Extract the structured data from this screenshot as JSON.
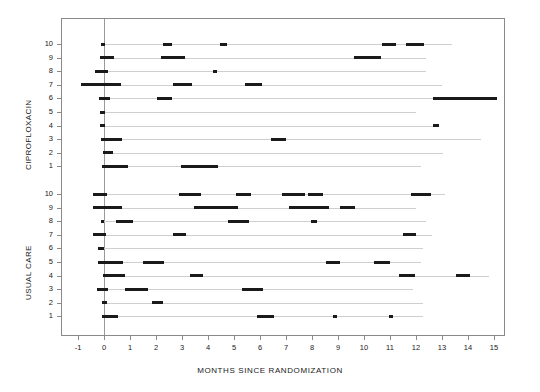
{
  "chart_data": {
    "type": "table",
    "title": "",
    "xlabel": "MONTHS SINCE RANDOMIZATION",
    "ylabel": "",
    "xlim": [
      -1.6,
      15.6
    ],
    "xticks": [
      -1,
      0,
      1,
      2,
      3,
      4,
      5,
      6,
      7,
      8,
      9,
      10,
      11,
      12,
      13,
      14,
      15
    ],
    "xticklabels": [
      "-1",
      "0",
      "1",
      "2",
      "3",
      "4",
      "5",
      "6",
      "7",
      "8",
      "9",
      "10",
      "11",
      "12",
      "13",
      "14",
      "15"
    ],
    "grid": false,
    "legend": null,
    "reference_line_x": 0,
    "groups": [
      {
        "name": "CIPROFLOXACIN",
        "label": "CIPROFLOXACIN",
        "subject_labels": [
          "10",
          "9",
          "8",
          "7",
          "6",
          "5",
          "4",
          "3",
          "2",
          "1"
        ],
        "subjects": [
          {
            "id": "10",
            "followup_end": 13.4,
            "episodes": [
              [
                -0.1,
                0.05
              ],
              [
                2.25,
                2.6
              ],
              [
                4.45,
                4.75
              ],
              [
                10.7,
                11.25
              ],
              [
                11.6,
                12.3
              ]
            ]
          },
          {
            "id": "9",
            "followup_end": 12.4,
            "episodes": [
              [
                -0.15,
                0.4
              ],
              [
                2.2,
                3.1
              ],
              [
                9.6,
                10.65
              ]
            ]
          },
          {
            "id": "8",
            "followup_end": 12.4,
            "episodes": [
              [
                -0.35,
                0.15
              ],
              [
                4.2,
                4.35
              ]
            ]
          },
          {
            "id": "7",
            "followup_end": 13.0,
            "episodes": [
              [
                -0.9,
                0.65
              ],
              [
                2.65,
                3.38
              ],
              [
                5.42,
                6.08
              ]
            ]
          },
          {
            "id": "6",
            "followup_end": 15.1,
            "episodes": [
              [
                -0.2,
                0.25
              ],
              [
                2.03,
                2.6
              ],
              [
                12.65,
                15.1
              ]
            ]
          },
          {
            "id": "5",
            "followup_end": 12.0,
            "episodes": [
              [
                -0.15,
                0.05
              ]
            ]
          },
          {
            "id": "4",
            "followup_end": 12.9,
            "episodes": [
              [
                -0.15,
                0.05
              ],
              [
                12.65,
                12.9
              ]
            ]
          },
          {
            "id": "3",
            "followup_end": 14.5,
            "episodes": [
              [
                -0.1,
                0.68
              ],
              [
                6.42,
                7.0
              ]
            ]
          },
          {
            "id": "2",
            "followup_end": 13.05,
            "episodes": [
              [
                -0.05,
                0.36
              ]
            ]
          },
          {
            "id": "1",
            "followup_end": 12.2,
            "episodes": [
              [
                -0.09,
                0.93
              ],
              [
                2.95,
                4.4
              ]
            ]
          }
        ]
      },
      {
        "name": "USUAL CARE",
        "label": "USUAL CARE",
        "subject_labels": [
          "10",
          "9",
          "8",
          "7",
          "6",
          "5",
          "4",
          "3",
          "2",
          "1"
        ],
        "subjects": [
          {
            "id": "10",
            "followup_end": 13.1,
            "episodes": [
              [
                -0.44,
                0.1
              ],
              [
                2.9,
                3.72
              ],
              [
                5.07,
                5.65
              ],
              [
                6.84,
                7.73
              ],
              [
                7.86,
                8.41
              ],
              [
                11.8,
                12.57
              ]
            ]
          },
          {
            "id": "9",
            "followup_end": 12.0,
            "episodes": [
              [
                -0.41,
                0.68
              ],
              [
                3.46,
                5.14
              ],
              [
                7.12,
                8.67
              ],
              [
                9.07,
                9.65
              ]
            ]
          },
          {
            "id": "8",
            "followup_end": 12.4,
            "episodes": [
              [
                -0.12,
                0.0
              ],
              [
                0.46,
                1.13
              ],
              [
                4.78,
                5.58
              ],
              [
                7.95,
                8.18
              ]
            ]
          },
          {
            "id": "7",
            "followup_end": 12.6,
            "episodes": [
              [
                -0.41,
                0.08
              ],
              [
                2.67,
                3.15
              ],
              [
                11.51,
                12.0
              ]
            ]
          },
          {
            "id": "6",
            "followup_end": 12.28,
            "episodes": [
              [
                -0.22,
                0.0
              ]
            ]
          },
          {
            "id": "5",
            "followup_end": 12.2,
            "episodes": [
              [
                -0.22,
                0.74
              ],
              [
                1.51,
                2.31
              ],
              [
                8.53,
                9.08
              ],
              [
                10.38,
                11.0
              ]
            ]
          },
          {
            "id": "4",
            "followup_end": 14.8,
            "episodes": [
              [
                -0.05,
                0.81
              ],
              [
                3.31,
                3.82
              ],
              [
                11.36,
                11.96
              ],
              [
                13.54,
                14.08
              ]
            ]
          },
          {
            "id": "3",
            "followup_end": 11.87,
            "episodes": [
              [
                -0.28,
                0.17
              ],
              [
                0.81,
                1.7
              ],
              [
                5.3,
                6.13
              ]
            ]
          },
          {
            "id": "2",
            "followup_end": 12.26,
            "episodes": [
              [
                -0.09,
                0.13
              ],
              [
                1.86,
                2.26
              ]
            ]
          },
          {
            "id": "1",
            "followup_end": 12.26,
            "episodes": [
              [
                -0.09,
                0.55
              ],
              [
                5.87,
                6.54
              ],
              [
                8.8,
                8.95
              ],
              [
                10.97,
                11.13
              ]
            ]
          }
        ]
      }
    ]
  },
  "axis": {
    "x_title": "MONTHS SINCE RANDOMIZATION",
    "tick_labels": [
      "-1",
      "0",
      "1",
      "2",
      "3",
      "4",
      "5",
      "6",
      "7",
      "8",
      "9",
      "10",
      "11",
      "12",
      "13",
      "14",
      "15"
    ]
  },
  "colors": {
    "bar": "#1a1a1a",
    "line": "#cfcfcf",
    "frame": "#8a8a8a",
    "reference": "#9a9a9a",
    "text": "#1a1a1a",
    "background": "#ffffff"
  }
}
